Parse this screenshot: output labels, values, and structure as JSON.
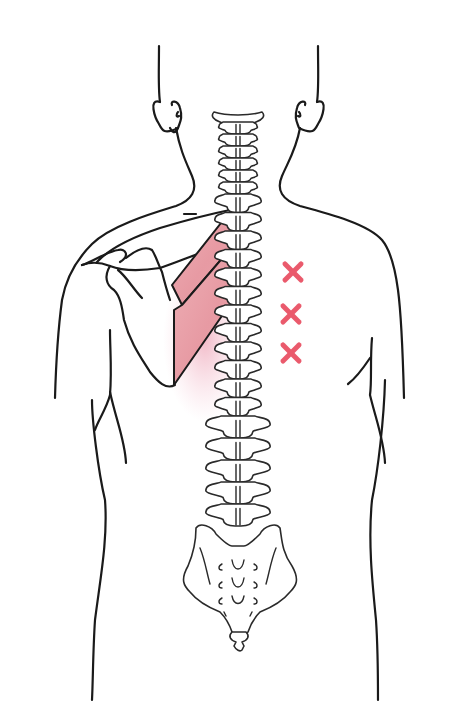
{
  "figure": {
    "view": "posterior",
    "highlighted_muscle": "rhomboid (major and minor), left side of image",
    "muscle_color": "#e9a0a8",
    "muscle_glow_color": "#f0b8c4",
    "marker_color": "#ea5a6c",
    "line_color": "#1a1a1a",
    "background": "#ffffff",
    "markers": [
      {
        "symbol": "x",
        "x": 293,
        "y": 272
      },
      {
        "symbol": "x",
        "x": 291,
        "y": 314
      },
      {
        "symbol": "x",
        "x": 291,
        "y": 353
      }
    ],
    "marker_count": 3,
    "regions": {
      "head": "head and ears outline",
      "spine": "cervical, thoracic and lumbar vertebrae",
      "sacrum": "sacrum and coccyx",
      "scapula": "left scapula",
      "torso": "torso outline"
    }
  }
}
